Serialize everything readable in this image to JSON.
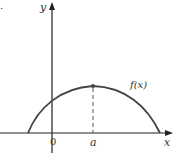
{
  "figure": {
    "panel_marker": ".",
    "axes": {
      "x_label": "x",
      "y_label": "y",
      "origin_label": "0"
    },
    "curve": {
      "label": "f(x)",
      "shape": "concave-down arch with maximum at x = a"
    },
    "max_point": {
      "x_label": "a"
    },
    "colors": {
      "curve": "#444444",
      "axes": "#222222",
      "dashed": "#555555"
    }
  }
}
